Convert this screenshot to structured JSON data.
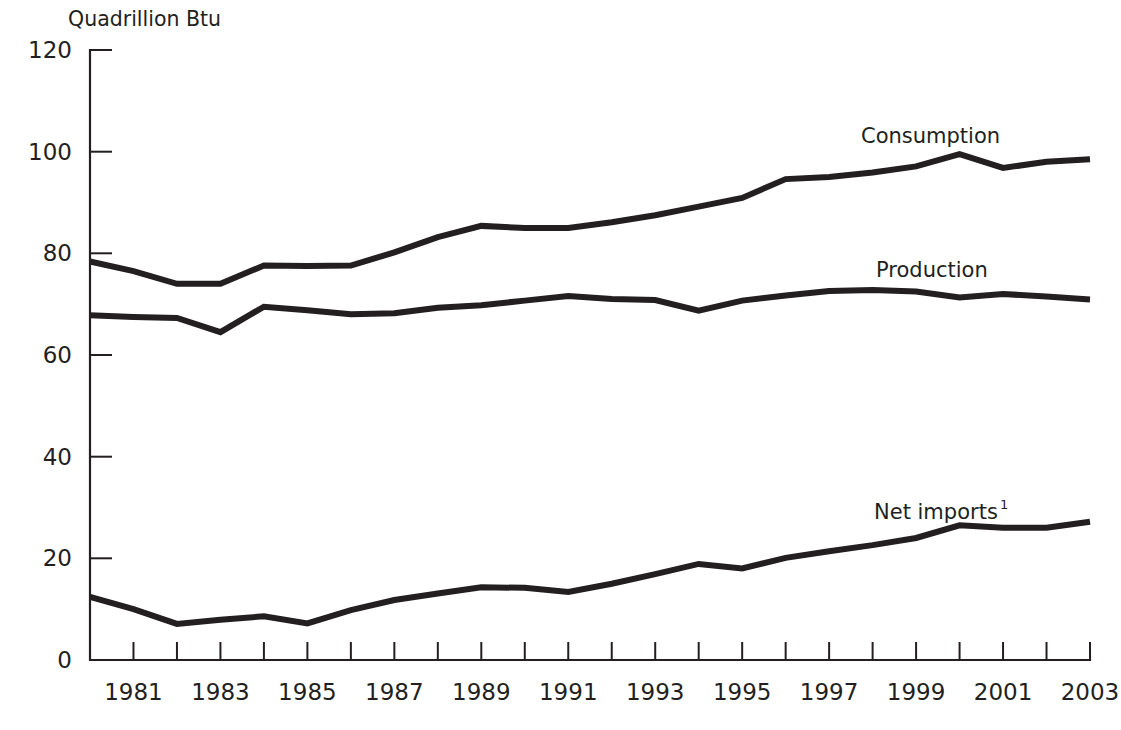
{
  "chart_data": {
    "type": "line",
    "title": "",
    "subtitle": "",
    "unit_label": "Quadrillion Btu",
    "xlabel": "",
    "ylabel": "Quadrillion Btu",
    "ylim": [
      0,
      120
    ],
    "xlim": [
      1980,
      2003
    ],
    "grid": false,
    "legend_position": "inline-right",
    "y_ticks": [
      "0",
      "20",
      "40",
      "60",
      "80",
      "100",
      "120"
    ],
    "y_tick_values": [
      0,
      20,
      40,
      60,
      80,
      100,
      120
    ],
    "x_tick_values": [
      1980,
      1981,
      1982,
      1983,
      1984,
      1985,
      1986,
      1987,
      1988,
      1989,
      1990,
      1991,
      1992,
      1993,
      1994,
      1995,
      1996,
      1997,
      1998,
      1999,
      2000,
      2001,
      2002,
      2003
    ],
    "x_tick_labels": [
      "",
      "1981",
      "",
      "1983",
      "",
      "1985",
      "",
      "1987",
      "",
      "1989",
      "",
      "1991",
      "",
      "1993",
      "",
      "1995",
      "",
      "1997",
      "",
      "1999",
      "",
      "2001",
      "",
      "2003"
    ],
    "x": [
      1980,
      1981,
      1982,
      1983,
      1984,
      1985,
      1986,
      1987,
      1988,
      1989,
      1990,
      1991,
      1992,
      1993,
      1994,
      1995,
      1996,
      1997,
      1998,
      1999,
      2000,
      2001,
      2002,
      2003
    ],
    "series": [
      {
        "name": "Consumption",
        "label": "Consumption",
        "annotation_note": "",
        "values": [
          78.4,
          76.5,
          74.0,
          74.0,
          77.6,
          77.5,
          77.6,
          80.2,
          83.2,
          85.4,
          85.0,
          85.0,
          86.1,
          87.5,
          89.2,
          90.9,
          94.6,
          95.0,
          95.9,
          97.1,
          99.5,
          96.8,
          98.0,
          98.5
        ]
      },
      {
        "name": "Production",
        "label": "Production",
        "annotation_note": "",
        "values": [
          67.8,
          67.5,
          67.3,
          64.5,
          69.5,
          68.8,
          68.0,
          68.2,
          69.3,
          69.8,
          70.7,
          71.6,
          71.0,
          70.8,
          68.7,
          70.7,
          71.7,
          72.6,
          72.8,
          72.5,
          71.3,
          72.0,
          71.5,
          70.9
        ]
      },
      {
        "name": "Net imports",
        "label": "Net imports",
        "annotation_note": "1",
        "values": [
          12.4,
          10.0,
          7.1,
          7.9,
          8.6,
          7.2,
          9.8,
          11.8,
          13.1,
          14.3,
          14.2,
          13.4,
          15.0,
          16.9,
          18.9,
          18.0,
          20.1,
          21.4,
          22.6,
          24.0,
          26.5,
          26.0,
          26.0,
          27.2
        ]
      }
    ]
  },
  "series_labels": {
    "consumption": "Consumption",
    "production": "Production",
    "net_imports": "Net imports",
    "net_imports_footnote": "1"
  }
}
